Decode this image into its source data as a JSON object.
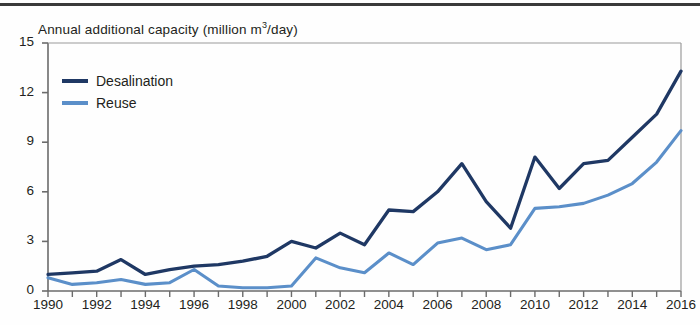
{
  "chart_data": {
    "type": "line",
    "title_main": "Annual additional capacity (million m",
    "title_sup": "3",
    "title_tail": "/day)",
    "xlabel": "",
    "ylabel": "Annual additional capacity (million m³/day)",
    "xlim": [
      1990,
      2016
    ],
    "ylim": [
      0,
      15
    ],
    "yticks": [
      0,
      3,
      6,
      9,
      12,
      15
    ],
    "ytick_labels": [
      "0",
      "3",
      "6",
      "9",
      "12",
      "15"
    ],
    "xticks": [
      1990,
      1991,
      1992,
      1993,
      1994,
      1995,
      1996,
      1997,
      1998,
      1999,
      2000,
      2001,
      2002,
      2003,
      2004,
      2005,
      2006,
      2007,
      2008,
      2009,
      2010,
      2011,
      2012,
      2013,
      2014,
      2015,
      2016
    ],
    "xtick_labels_shown": [
      "1990",
      "1992",
      "1994",
      "1996",
      "1998",
      "2000",
      "2002",
      "2004",
      "2006",
      "2008",
      "2010",
      "2012",
      "2014",
      "2016"
    ],
    "grid": false,
    "legend_position": "top-left",
    "x": [
      1990,
      1991,
      1992,
      1993,
      1994,
      1995,
      1996,
      1997,
      1998,
      1999,
      2000,
      2001,
      2002,
      2003,
      2004,
      2005,
      2006,
      2007,
      2008,
      2009,
      2010,
      2011,
      2012,
      2013,
      2014,
      2015,
      2016
    ],
    "series": [
      {
        "name": "Desalination",
        "color": "#1f3864",
        "values": [
          1.0,
          1.1,
          1.2,
          1.9,
          1.0,
          1.3,
          1.5,
          1.6,
          1.8,
          2.1,
          3.0,
          2.6,
          3.5,
          2.8,
          4.9,
          4.8,
          6.0,
          7.7,
          5.4,
          3.8,
          8.1,
          6.2,
          7.7,
          7.9,
          9.3,
          10.7,
          13.3
        ]
      },
      {
        "name": "Reuse",
        "color": "#5b8fc9",
        "values": [
          0.8,
          0.4,
          0.5,
          0.7,
          0.4,
          0.5,
          1.3,
          0.3,
          0.2,
          0.2,
          0.3,
          2.0,
          1.4,
          1.1,
          2.3,
          1.6,
          2.9,
          3.2,
          2.5,
          2.8,
          5.0,
          5.1,
          5.3,
          5.8,
          6.5,
          7.8,
          9.7
        ]
      }
    ]
  },
  "legend": {
    "items": [
      {
        "label": "Desalination",
        "color": "#1f3864"
      },
      {
        "label": "Reuse",
        "color": "#5b8fc9"
      }
    ]
  }
}
